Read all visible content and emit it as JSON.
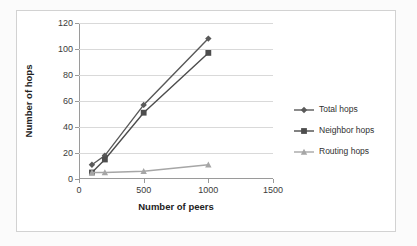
{
  "chart_data": {
    "type": "line",
    "title": "",
    "xlabel": "Number of peers",
    "ylabel": "Number of hops",
    "x": [
      100,
      200,
      500,
      1000
    ],
    "xlim": [
      0,
      1500
    ],
    "ylim": [
      0,
      120
    ],
    "xticks": [
      "0",
      "500",
      "1000",
      "1500"
    ],
    "xtick_values": [
      0,
      500,
      1000,
      1500
    ],
    "yticks": [
      "0",
      "20",
      "40",
      "60",
      "80",
      "100",
      "120"
    ],
    "ytick_values": [
      0,
      20,
      40,
      60,
      80,
      100,
      120
    ],
    "grid": "horizontal",
    "legend_position": "right",
    "series": [
      {
        "name": "Total hops",
        "marker": "diamond",
        "color": "#595959",
        "values": [
          11,
          18,
          57,
          108
        ]
      },
      {
        "name": "Neighbor hops",
        "marker": "square",
        "color": "#4d4d4d",
        "values": [
          5,
          15,
          51,
          97
        ]
      },
      {
        "name": "Routing hops",
        "marker": "triangle",
        "color": "#a6a6a6",
        "values": [
          5,
          5,
          6,
          11
        ]
      }
    ]
  },
  "legend": {
    "items": [
      {
        "label": "Total hops"
      },
      {
        "label": "Neighbor hops"
      },
      {
        "label": "Routing hops"
      }
    ]
  },
  "axes": {
    "x_title": "Number of peers",
    "y_title": "Number of hops"
  },
  "colors": {
    "plot_background": "#ffffff",
    "gridline": "#d9d9d9",
    "axis": "#9a9a9a",
    "text": "#3b3b3b",
    "series_dark": "#595959",
    "series_mid": "#4d4d4d",
    "series_light": "#a6a6a6"
  }
}
